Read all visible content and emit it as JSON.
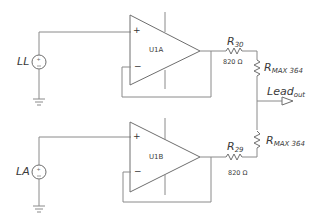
{
  "diagram": {
    "type": "circuit-schematic",
    "sources": [
      {
        "id": "LL",
        "label": "LL"
      },
      {
        "id": "LA",
        "label": "LA"
      }
    ],
    "opamps": [
      {
        "id": "U1A",
        "label": "U1A",
        "plus": "+",
        "minus": "−"
      },
      {
        "id": "U1B",
        "label": "U1B",
        "plus": "+",
        "minus": "−"
      }
    ],
    "resistors": [
      {
        "name": "R",
        "sub": "30",
        "value": "820 Ω"
      },
      {
        "name": "R",
        "sub": "MAX 364"
      },
      {
        "name": "R",
        "sub": "MAX 364"
      },
      {
        "name": "R",
        "sub": "29",
        "value": "820 Ω"
      }
    ],
    "output": {
      "name": "Lead",
      "sub": "out"
    },
    "colors": {
      "wire": "#8a8a8a",
      "text": "#3a3a3a"
    }
  }
}
